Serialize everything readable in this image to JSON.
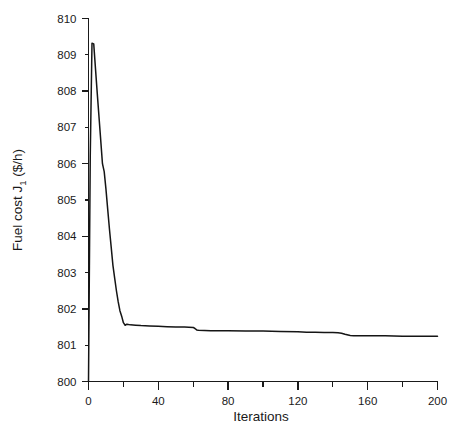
{
  "chart_data": {
    "type": "line",
    "title": "",
    "xlabel": "Iterations",
    "ylabel": "Fuel cost J1 ($/h)",
    "ylabel_main": "Fuel cost J",
    "ylabel_sub": "1",
    "ylabel_tail": " ($/h)",
    "xlim": [
      0,
      200
    ],
    "ylim": [
      800,
      810
    ],
    "grid": false,
    "legend": null,
    "x_major_ticks": [
      0,
      40,
      80,
      120,
      160,
      200
    ],
    "x_minor_ticks": [
      20,
      60,
      100,
      140,
      180
    ],
    "x_tick_labels": [
      "0",
      "40",
      "80",
      "120",
      "160",
      "200"
    ],
    "y_major_ticks": [
      800,
      801,
      802,
      803,
      804,
      805,
      806,
      807,
      808,
      809,
      810
    ],
    "y_tick_labels": [
      "800",
      "801",
      "802",
      "803",
      "804",
      "805",
      "806",
      "807",
      "808",
      "809",
      "810"
    ],
    "series": [
      {
        "name": "Fuel cost J1",
        "x": [
          0,
          1,
          2,
          3,
          4,
          5,
          6,
          7,
          8,
          9,
          10,
          11,
          12,
          13,
          14,
          15,
          16,
          17,
          18,
          19,
          20,
          21,
          22,
          24,
          27,
          30,
          35,
          40,
          45,
          50,
          55,
          60,
          61,
          62,
          63,
          70,
          80,
          90,
          100,
          110,
          120,
          125,
          130,
          135,
          140,
          143,
          145,
          147,
          150,
          152,
          155,
          160,
          170,
          180,
          190,
          200
        ],
        "y": [
          800.0,
          806.2,
          809.32,
          809.3,
          808.62,
          807.95,
          807.3,
          806.65,
          806.0,
          805.78,
          805.3,
          804.75,
          804.2,
          803.7,
          803.2,
          802.85,
          802.5,
          802.2,
          801.95,
          801.8,
          801.62,
          801.55,
          801.58,
          801.56,
          801.55,
          801.54,
          801.53,
          801.52,
          801.51,
          801.5,
          801.5,
          801.49,
          801.46,
          801.42,
          801.41,
          801.4,
          801.4,
          801.39,
          801.39,
          801.38,
          801.37,
          801.36,
          801.36,
          801.35,
          801.35,
          801.34,
          801.33,
          801.3,
          801.27,
          801.26,
          801.26,
          801.26,
          801.26,
          801.25,
          801.25,
          801.25
        ]
      }
    ]
  }
}
